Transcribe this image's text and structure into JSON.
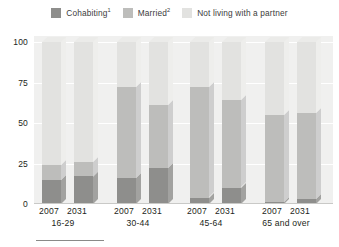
{
  "legend": {
    "items": [
      {
        "label": "Cohabiting",
        "footnote": "1",
        "color": "#8e8e8c",
        "name": "cohabiting"
      },
      {
        "label": "Married",
        "footnote": "2",
        "color": "#bdbdbb",
        "name": "married"
      },
      {
        "label": "Not living with a partner",
        "footnote": "",
        "color": "#e2e2e0",
        "name": "not-living-with-a-partner"
      }
    ]
  },
  "axis": {
    "yticks": [
      "0",
      "25",
      "50",
      "75",
      "100"
    ],
    "ymin": 0,
    "ymax": 100
  },
  "groups": [
    {
      "range": "16-29",
      "years": [
        "2007",
        "2031"
      ]
    },
    {
      "range": "30-44",
      "years": [
        "2007",
        "2031"
      ]
    },
    {
      "range": "45-64",
      "years": [
        "2007",
        "2031"
      ]
    },
    {
      "range": "65 and over",
      "years": [
        "2007",
        "2031"
      ]
    }
  ],
  "colors": {
    "cohabiting": "#8e8e8c",
    "married": "#bdbdbb",
    "not_partner": "#e2e2e0",
    "cohabiting_side": "#a2a2a0",
    "married_side": "#cecece",
    "not_partner_side": "#eeeeec",
    "cohabiting_top": "#9b9b99",
    "married_top": "#c8c8c6",
    "not_partner_top": "#ebebe9",
    "plot_bg": "#f0f0ef",
    "gridline": "#ffffff",
    "text": "#231f20"
  },
  "chart_data": {
    "type": "bar",
    "title": "",
    "subtitle": "",
    "xlabel": "",
    "ylabel": "",
    "ylim": [
      0,
      100
    ],
    "grid": true,
    "stacked": true,
    "legend_position": "top",
    "categories": [
      "16-29 2007",
      "16-29 2031",
      "30-44 2007",
      "30-44 2031",
      "45-64 2007",
      "45-64 2031",
      "65 and over 2007",
      "65 and over 2031"
    ],
    "series": [
      {
        "name": "Cohabiting",
        "values": [
          15,
          17,
          16,
          22,
          4,
          10,
          1,
          3
        ]
      },
      {
        "name": "Married",
        "values": [
          9,
          9,
          56,
          39,
          68,
          54,
          54,
          53
        ]
      },
      {
        "name": "Not living with a partner",
        "values": [
          76,
          74,
          28,
          39,
          28,
          36,
          45,
          44
        ]
      }
    ],
    "bars": [
      {
        "group": "16-29",
        "year": "2007",
        "cohabiting": 15,
        "married": 9,
        "not_partner": 76,
        "cum_cohabiting": 15,
        "cum_married": 24
      },
      {
        "group": "16-29",
        "year": "2031",
        "cohabiting": 17,
        "married": 9,
        "not_partner": 74,
        "cum_cohabiting": 17,
        "cum_married": 26
      },
      {
        "group": "30-44",
        "year": "2007",
        "cohabiting": 16,
        "married": 56,
        "not_partner": 28,
        "cum_cohabiting": 16,
        "cum_married": 72
      },
      {
        "group": "30-44",
        "year": "2031",
        "cohabiting": 22,
        "married": 39,
        "not_partner": 39,
        "cum_cohabiting": 22,
        "cum_married": 61
      },
      {
        "group": "45-64",
        "year": "2007",
        "cohabiting": 4,
        "married": 68,
        "not_partner": 28,
        "cum_cohabiting": 4,
        "cum_married": 72
      },
      {
        "group": "45-64",
        "year": "2031",
        "cohabiting": 10,
        "married": 54,
        "not_partner": 36,
        "cum_cohabiting": 10,
        "cum_married": 64
      },
      {
        "group": "65 and over",
        "year": "2007",
        "cohabiting": 1,
        "married": 54,
        "not_partner": 45,
        "cum_cohabiting": 1,
        "cum_married": 55
      },
      {
        "group": "65 and over",
        "year": "2031",
        "cohabiting": 3,
        "married": 53,
        "not_partner": 44,
        "cum_cohabiting": 3,
        "cum_married": 56
      }
    ]
  }
}
